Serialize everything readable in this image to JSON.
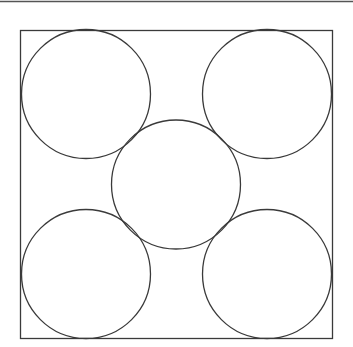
{
  "diagram": {
    "stroke_color": "#3a3a3a",
    "background": "#ffffff",
    "top_rule": {
      "x1": 0,
      "y1": 1.5,
      "x2": 353,
      "y2": 1.5
    },
    "square": {
      "x": 20.5,
      "y": 30.5,
      "width": 312,
      "height": 308
    },
    "circles": [
      {
        "id": "top-left",
        "cx": 86,
        "cy": 94,
        "r": 64.5
      },
      {
        "id": "top-right",
        "cx": 267,
        "cy": 94,
        "r": 64.5
      },
      {
        "id": "center",
        "cx": 176,
        "cy": 184.5,
        "r": 64.5
      },
      {
        "id": "bottom-left",
        "cx": 86,
        "cy": 274,
        "r": 64.5
      },
      {
        "id": "bottom-right",
        "cx": 267,
        "cy": 274,
        "r": 64.5
      }
    ]
  }
}
